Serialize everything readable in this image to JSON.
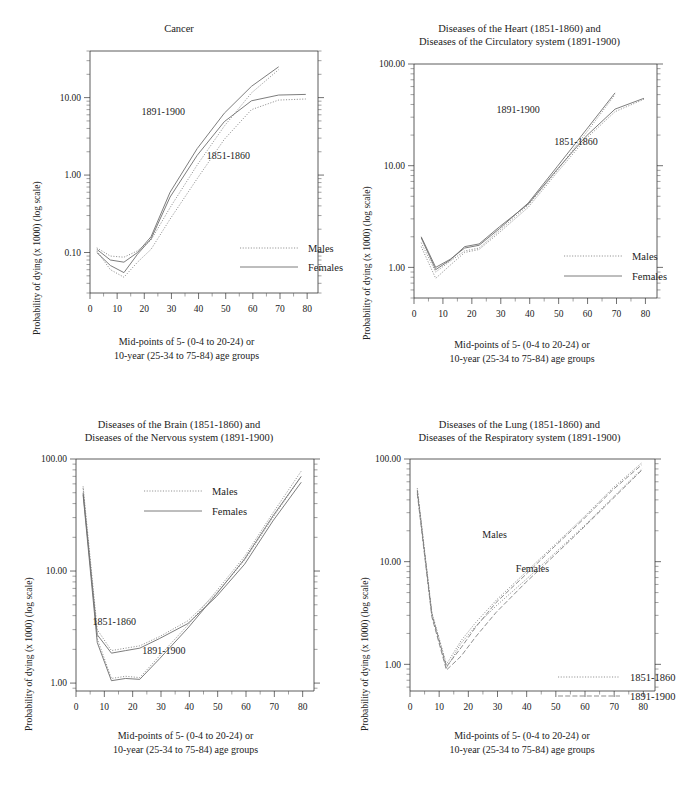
{
  "page": {
    "width": 691,
    "height": 792,
    "background": "#ffffff",
    "ink": "#1a1a1a"
  },
  "common": {
    "ylabel": "Probability of dying (x 1000) (log scale)",
    "xlabel_line1": "Mid-points of 5- (0-4 to 20-24) or",
    "xlabel_line2": "10-year (25-34 to 75-84) age groups",
    "xticks": [
      "0",
      "10",
      "20",
      "30",
      "40",
      "50",
      "60",
      "70",
      "80"
    ],
    "xlim": [
      0,
      84
    ],
    "series_names": [
      "Males",
      "Females"
    ],
    "period_names": [
      "1851-1860",
      "1891-1900"
    ]
  },
  "chart_data": [
    {
      "id": "cancer",
      "type": "line",
      "title_lines": [
        "Cancer"
      ],
      "xlabel": "Mid-points of 5- (0-4 to 20-24) or 10-year (25-34 to 75-84) age groups",
      "ylabel": "Probability of dying (x 1000) (log scale)",
      "log_y": true,
      "ylim": [
        0.03,
        40
      ],
      "yticks": [
        0.1,
        1.0,
        10.0
      ],
      "yticklabels": [
        "0.10",
        "1.00",
        "10.00"
      ],
      "xlim": [
        0,
        84
      ],
      "xticks": [
        0,
        10,
        20,
        30,
        40,
        50,
        60,
        70,
        80
      ],
      "grid": false,
      "legend": {
        "position": "inside-bottom-right",
        "entries": [
          {
            "label": "Males",
            "style": "dotted"
          },
          {
            "label": "Females",
            "style": "solid"
          }
        ]
      },
      "annotations": [
        {
          "text": "1891-1900",
          "x": 27,
          "y": 6.0
        },
        {
          "text": "1851-1860",
          "x": 51,
          "y": 1.6
        }
      ],
      "x": [
        2.5,
        7.5,
        12.5,
        17.5,
        22.5,
        29.5,
        39.5,
        49.5,
        59.5,
        69.5,
        79.5
      ],
      "series": [
        {
          "name": "Males 1891-1900",
          "style": "dotted",
          "period": "1891-1900",
          "values": [
            0.115,
            0.09,
            0.087,
            0.105,
            0.145,
            0.38,
            1.35,
            4.3,
            11.5,
            23.0,
            null
          ]
        },
        {
          "name": "Females 1891-1900",
          "style": "solid",
          "period": "1891-1900",
          "values": [
            0.11,
            0.08,
            0.075,
            0.1,
            0.16,
            0.6,
            2.2,
            6.3,
            14.0,
            25.0,
            null
          ]
        },
        {
          "name": "Males 1851-1860",
          "style": "dotted",
          "period": "1851-1860",
          "values": [
            0.105,
            0.06,
            0.048,
            0.075,
            0.11,
            0.27,
            0.9,
            2.9,
            7.0,
            9.3,
            9.6
          ]
        },
        {
          "name": "Females 1851-1860",
          "style": "solid",
          "period": "1851-1860",
          "values": [
            0.1,
            0.068,
            0.055,
            0.095,
            0.15,
            0.52,
            1.8,
            4.9,
            9.1,
            10.8,
            11.0
          ]
        }
      ]
    },
    {
      "id": "heart-circulatory",
      "type": "line",
      "title_lines": [
        "Diseases of the Heart (1851-1860) and",
        "Diseases of the Circulatory system (1891-1900)"
      ],
      "xlabel": "Mid-points of 5- (0-4 to 20-24) or 10-year (25-34 to 75-84) age groups",
      "ylabel": "Probability of dying (x 1000) (log scale)",
      "log_y": true,
      "ylim": [
        0.5,
        100
      ],
      "yticks": [
        1.0,
        10.0,
        100.0
      ],
      "yticklabels": [
        "1.00",
        "10.00",
        "100.00"
      ],
      "xlim": [
        0,
        84
      ],
      "xticks": [
        0,
        10,
        20,
        30,
        40,
        50,
        60,
        70,
        80
      ],
      "grid": false,
      "legend": {
        "position": "inside-bottom-right",
        "entries": [
          {
            "label": "Males",
            "style": "dotted"
          },
          {
            "label": "Females",
            "style": "solid"
          }
        ]
      },
      "annotations": [
        {
          "text": "1891-1900",
          "x": 36,
          "y": 33
        },
        {
          "text": "1851-1860",
          "x": 56,
          "y": 16
        }
      ],
      "x": [
        2.5,
        7.5,
        12.5,
        17.5,
        22.5,
        29.5,
        39.5,
        49.5,
        59.5,
        69.5,
        79.5
      ],
      "series": [
        {
          "name": "Males 1891-1900",
          "style": "dotted",
          "period": "1891-1900",
          "values": [
            1.75,
            0.9,
            1.15,
            1.45,
            1.55,
            2.3,
            4.1,
            9.0,
            21.0,
            50.0,
            null
          ]
        },
        {
          "name": "Females 1891-1900",
          "style": "solid",
          "period": "1891-1900",
          "values": [
            2.0,
            1.0,
            1.2,
            1.55,
            1.65,
            2.4,
            4.3,
            9.8,
            22.5,
            52.0,
            null
          ]
        },
        {
          "name": "Males 1851-1860",
          "style": "dotted",
          "period": "1851-1860",
          "values": [
            1.6,
            0.78,
            1.05,
            1.4,
            1.5,
            2.2,
            3.9,
            8.6,
            18.5,
            34.0,
            45.0
          ]
        },
        {
          "name": "Females 1851-1860",
          "style": "solid",
          "period": "1851-1860",
          "values": [
            1.95,
            0.95,
            1.18,
            1.6,
            1.7,
            2.5,
            4.2,
            9.2,
            19.5,
            36.0,
            46.0
          ]
        }
      ]
    },
    {
      "id": "brain-nervous",
      "type": "line",
      "title_lines": [
        "Diseases of the Brain (1851-1860) and",
        "Diseases of the Nervous system (1891-1900)"
      ],
      "xlabel": "Mid-points of 5- (0-4 to 20-24) or 10-year (25-34 to 75-84) age groups",
      "ylabel": "Probability of dying (x 1000) (log scale)",
      "log_y": true,
      "ylim": [
        0.85,
        100
      ],
      "yticks": [
        1.0,
        10.0,
        100.0
      ],
      "yticklabels": [
        "1.00",
        "10.00",
        "100.00"
      ],
      "xlim": [
        0,
        84
      ],
      "xticks": [
        0,
        10,
        20,
        30,
        40,
        50,
        60,
        70,
        80
      ],
      "grid": false,
      "legend": {
        "position": "inside-top-left",
        "entries": [
          {
            "label": "Males",
            "style": "dotted"
          },
          {
            "label": "Females",
            "style": "solid"
          }
        ]
      },
      "annotations": [
        {
          "text": "1851-1860",
          "x": 13.5,
          "y": 3.3
        },
        {
          "text": "1891-1900",
          "x": 31,
          "y": 1.8
        }
      ],
      "x": [
        2.5,
        7.5,
        12.5,
        17.5,
        22.5,
        29.5,
        39.5,
        49.5,
        59.5,
        69.5,
        79.5
      ],
      "series": [
        {
          "name": "Males 1851-1860",
          "style": "dotted",
          "period": "1851-1860",
          "values": [
            57.0,
            3.0,
            1.95,
            2.05,
            2.15,
            2.6,
            3.6,
            6.3,
            12.5,
            30.0,
            70.0
          ]
        },
        {
          "name": "Females 1851-1860",
          "style": "solid",
          "period": "1851-1860",
          "values": [
            50.0,
            2.7,
            1.85,
            1.95,
            2.05,
            2.5,
            3.4,
            5.9,
            11.5,
            28.0,
            62.0
          ]
        },
        {
          "name": "Males 1891-1900",
          "style": "dotted",
          "period": "1891-1900",
          "values": [
            55.0,
            2.5,
            1.1,
            1.15,
            1.12,
            1.75,
            3.3,
            6.6,
            13.5,
            33.0,
            78.0
          ]
        },
        {
          "name": "Females 1891-1900",
          "style": "solid",
          "period": "1891-1900",
          "values": [
            48.0,
            2.3,
            1.05,
            1.1,
            1.08,
            1.65,
            3.1,
            6.2,
            12.8,
            31.0,
            70.0
          ]
        }
      ]
    },
    {
      "id": "lung-respiratory",
      "type": "line",
      "title_lines": [
        "Diseases of the Lung (1851-1860) and",
        "Diseases of the Respiratory system (1891-1900)"
      ],
      "xlabel": "Mid-points of 5- (0-4 to 20-24) or 10-year (25-34 to 75-84) age groups",
      "ylabel": "Probability of dying (x 1000) (log scale)",
      "log_y": true,
      "ylim": [
        0.55,
        100
      ],
      "yticks": [
        1.0,
        10.0,
        100.0
      ],
      "yticklabels": [
        "1.00",
        "10.00",
        "100.00"
      ],
      "xlim": [
        0,
        84
      ],
      "xticks": [
        0,
        10,
        20,
        30,
        40,
        50,
        60,
        70,
        80
      ],
      "grid": false,
      "legend": {
        "position": "inside-bottom-right",
        "entries": [
          {
            "label": "1851-1860",
            "style": "dotted"
          },
          {
            "label": "1891-1900",
            "style": "dashdot"
          }
        ]
      },
      "annotations": [
        {
          "text": "Males",
          "x": 29,
          "y": 17
        },
        {
          "text": "Females",
          "x": 42,
          "y": 8.0
        }
      ],
      "x": [
        2.5,
        7.5,
        12.5,
        17.5,
        22.5,
        29.5,
        39.5,
        49.5,
        59.5,
        69.5,
        79.5
      ],
      "series": [
        {
          "name": "Males 1851-1860",
          "style": "dotted",
          "period": "1851-1860",
          "values": [
            52.0,
            3.2,
            1.0,
            1.7,
            2.55,
            4.2,
            7.8,
            14.5,
            27.0,
            52.0,
            92.0
          ]
        },
        {
          "name": "Females 1851-1860",
          "style": "dotted",
          "period": "1851-1860",
          "values": [
            48.0,
            3.0,
            0.92,
            1.6,
            2.35,
            3.7,
            6.6,
            12.0,
            22.0,
            42.0,
            80.0
          ]
        },
        {
          "name": "Males 1891-1900",
          "style": "dashdot",
          "period": "1891-1900",
          "values": [
            50.0,
            3.1,
            0.95,
            1.45,
            2.3,
            4.0,
            7.4,
            14.0,
            26.0,
            50.0,
            88.0
          ]
        },
        {
          "name": "Females 1891-1900",
          "style": "dashdot",
          "period": "1891-1900",
          "values": [
            46.0,
            2.9,
            0.88,
            1.2,
            1.85,
            3.2,
            6.2,
            11.5,
            21.5,
            41.0,
            78.0
          ]
        }
      ]
    }
  ]
}
